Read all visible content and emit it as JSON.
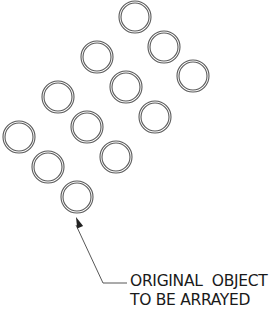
{
  "diagram": {
    "colors": {
      "ring": "#5a5a5a",
      "leader": "#444444",
      "text": "#1a1a1a"
    },
    "ring": {
      "outer_radius": 16,
      "inner_radius": 14
    },
    "circles": [
      {
        "row": 1,
        "col": 1,
        "cx": 135,
        "cy": 17
      },
      {
        "row": 1,
        "col": 2,
        "cx": 164,
        "cy": 47
      },
      {
        "row": 1,
        "col": 3,
        "cx": 193,
        "cy": 76
      },
      {
        "row": 2,
        "col": 1,
        "cx": 97,
        "cy": 57
      },
      {
        "row": 2,
        "col": 2,
        "cx": 126,
        "cy": 87
      },
      {
        "row": 2,
        "col": 3,
        "cx": 155,
        "cy": 117
      },
      {
        "row": 3,
        "col": 1,
        "cx": 58,
        "cy": 97
      },
      {
        "row": 3,
        "col": 2,
        "cx": 87,
        "cy": 127
      },
      {
        "row": 3,
        "col": 3,
        "cx": 116,
        "cy": 157
      },
      {
        "row": 4,
        "col": 1,
        "cx": 19,
        "cy": 137
      },
      {
        "row": 4,
        "col": 2,
        "cx": 48,
        "cy": 167
      },
      {
        "row": 4,
        "col": 3,
        "cx": 77,
        "cy": 197,
        "original": true
      }
    ],
    "callout": {
      "line1": "ORIGINAL  OBJECT",
      "line2": "TO BE ARRAYED",
      "arrow_tip": [
        76,
        217
      ],
      "elbow": [
        103,
        283
      ],
      "line_end": [
        127,
        283
      ]
    }
  }
}
